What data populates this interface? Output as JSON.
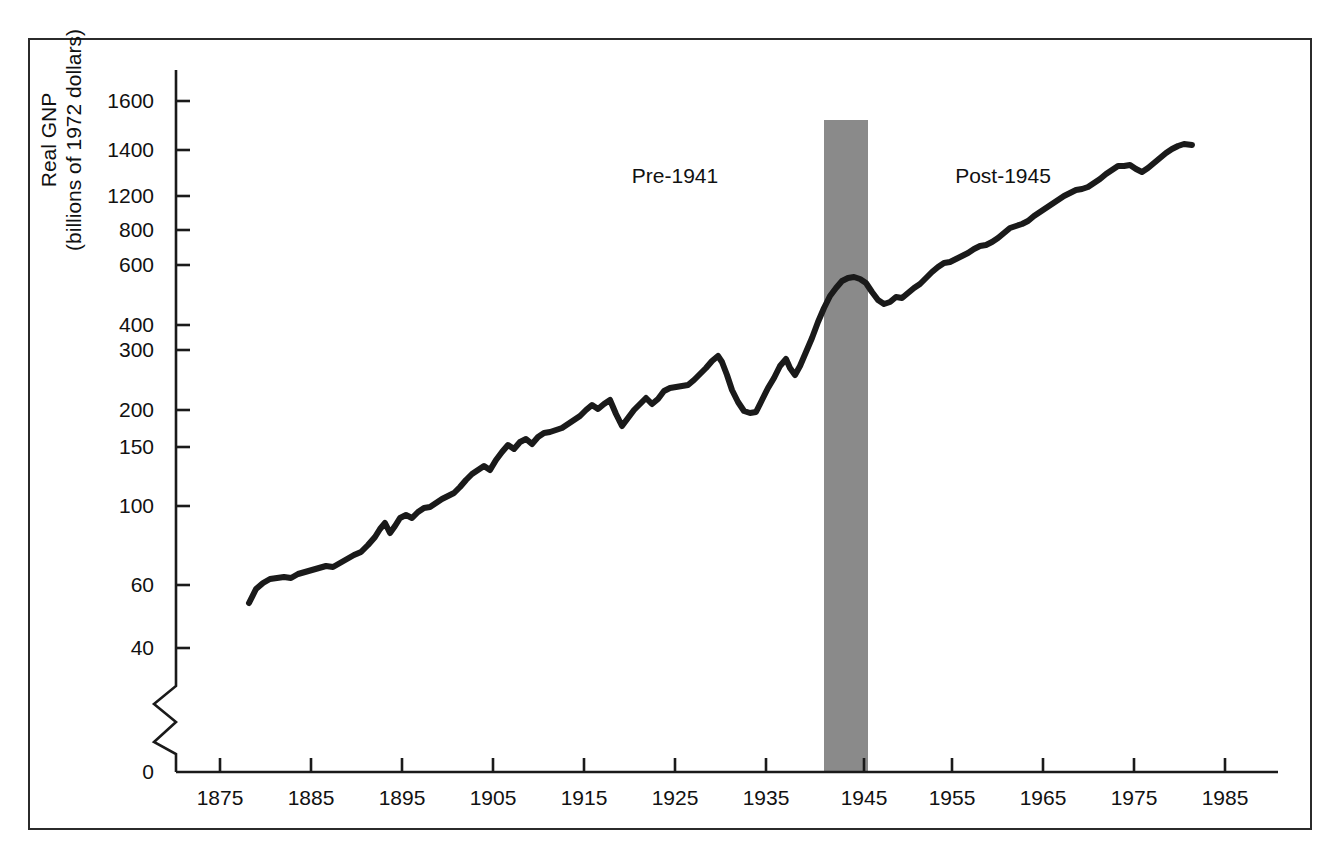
{
  "chart_data": {
    "type": "line",
    "title": "",
    "xlabel": "",
    "ylabel": "Real GNP\n(billions of 1972 dollars)",
    "ylabel_line1": "Real GNP",
    "ylabel_line2": "(billions of 1972 dollars)",
    "y_scale": "log-like-broken",
    "y_axis_note": "axis broken between 40 and 0",
    "y_ticks": [
      {
        "label": "1600",
        "value": 1600,
        "py": 101
      },
      {
        "label": "1400",
        "value": 1400,
        "py": 150
      },
      {
        "label": "1200",
        "value": 1200,
        "py": 196
      },
      {
        "label": "800",
        "value": 800,
        "py": 230
      },
      {
        "label": "600",
        "value": 600,
        "py": 265
      },
      {
        "label": "400",
        "value": 400,
        "py": 325
      },
      {
        "label": "300",
        "value": 300,
        "py": 350
      },
      {
        "label": "200",
        "value": 200,
        "py": 410
      },
      {
        "label": "150",
        "value": 150,
        "py": 447
      },
      {
        "label": "100",
        "value": 100,
        "py": 506
      },
      {
        "label": "60",
        "value": 60,
        "py": 585
      },
      {
        "label": "40",
        "value": 40,
        "py": 648
      },
      {
        "label": "0",
        "value": 0,
        "py": 772
      }
    ],
    "x_ticks": [
      {
        "label": "1875",
        "value": 1875,
        "px": 220
      },
      {
        "label": "1885",
        "value": 1885,
        "px": 311
      },
      {
        "label": "1895",
        "value": 1895,
        "px": 402
      },
      {
        "label": "1905",
        "value": 1905,
        "px": 493
      },
      {
        "label": "1915",
        "value": 1915,
        "px": 584
      },
      {
        "label": "1925",
        "value": 1925,
        "px": 675
      },
      {
        "label": "1935",
        "value": 1935,
        "px": 766
      },
      {
        "label": "1945",
        "value": 1945,
        "px": 864
      },
      {
        "label": "1955",
        "value": 1955,
        "px": 952
      },
      {
        "label": "1965",
        "value": 1965,
        "px": 1043
      },
      {
        "label": "1975",
        "value": 1975,
        "px": 1134
      },
      {
        "label": "1985",
        "value": 1985,
        "px": 1225
      }
    ],
    "xlim": [
      1869,
      1988
    ],
    "grid": false,
    "legend": null,
    "annotations": [
      {
        "text": "Pre-1941",
        "px": 675,
        "py": 176
      },
      {
        "text": "Post-1945",
        "px": 1003,
        "py": 176
      }
    ],
    "shaded_regions": [
      {
        "label": "World War II",
        "x_start": 1941,
        "x_end": 1945,
        "px_left": 824,
        "px_right": 868,
        "py_top": 120,
        "py_bottom": 772,
        "color": "#8a8a8a"
      }
    ],
    "series": [
      {
        "name": "Real GNP",
        "color": "#1a1a1a",
        "line_width": 6,
        "points": [
          [
            249,
            603
          ],
          [
            256,
            589
          ],
          [
            263,
            583
          ],
          [
            270,
            579
          ],
          [
            277,
            578
          ],
          [
            284,
            577
          ],
          [
            291,
            578
          ],
          [
            298,
            574
          ],
          [
            305,
            572
          ],
          [
            312,
            570
          ],
          [
            319,
            568
          ],
          [
            326,
            566
          ],
          [
            333,
            567
          ],
          [
            340,
            563
          ],
          [
            347,
            559
          ],
          [
            354,
            555
          ],
          [
            361,
            552
          ],
          [
            368,
            545
          ],
          [
            375,
            537
          ],
          [
            380,
            529
          ],
          [
            385,
            523
          ],
          [
            390,
            533
          ],
          [
            395,
            526
          ],
          [
            400,
            518
          ],
          [
            406,
            515
          ],
          [
            412,
            518
          ],
          [
            418,
            512
          ],
          [
            424,
            508
          ],
          [
            430,
            507
          ],
          [
            436,
            503
          ],
          [
            442,
            499
          ],
          [
            448,
            496
          ],
          [
            454,
            493
          ],
          [
            460,
            487
          ],
          [
            466,
            480
          ],
          [
            472,
            474
          ],
          [
            478,
            470
          ],
          [
            484,
            466
          ],
          [
            490,
            470
          ],
          [
            496,
            460
          ],
          [
            502,
            452
          ],
          [
            508,
            445
          ],
          [
            514,
            449
          ],
          [
            520,
            442
          ],
          [
            526,
            439
          ],
          [
            532,
            444
          ],
          [
            538,
            437
          ],
          [
            544,
            433
          ],
          [
            550,
            432
          ],
          [
            556,
            430
          ],
          [
            562,
            428
          ],
          [
            568,
            424
          ],
          [
            574,
            420
          ],
          [
            580,
            416
          ],
          [
            586,
            410
          ],
          [
            592,
            405
          ],
          [
            598,
            409
          ],
          [
            604,
            404
          ],
          [
            610,
            400
          ],
          [
            616,
            414
          ],
          [
            622,
            426
          ],
          [
            628,
            418
          ],
          [
            634,
            410
          ],
          [
            640,
            404
          ],
          [
            646,
            398
          ],
          [
            652,
            404
          ],
          [
            658,
            399
          ],
          [
            664,
            391
          ],
          [
            670,
            388
          ],
          [
            676,
            387
          ],
          [
            682,
            386
          ],
          [
            688,
            385
          ],
          [
            694,
            380
          ],
          [
            700,
            374
          ],
          [
            706,
            368
          ],
          [
            712,
            361
          ],
          [
            718,
            356
          ],
          [
            722,
            362
          ],
          [
            727,
            375
          ],
          [
            732,
            390
          ],
          [
            738,
            402
          ],
          [
            744,
            411
          ],
          [
            750,
            413
          ],
          [
            756,
            412
          ],
          [
            762,
            400
          ],
          [
            768,
            388
          ],
          [
            774,
            378
          ],
          [
            780,
            366
          ],
          [
            786,
            359
          ],
          [
            790,
            368
          ],
          [
            795,
            375
          ],
          [
            800,
            366
          ],
          [
            806,
            352
          ],
          [
            812,
            338
          ],
          [
            818,
            322
          ],
          [
            824,
            308
          ],
          [
            830,
            296
          ],
          [
            836,
            288
          ],
          [
            842,
            281
          ],
          [
            848,
            278
          ],
          [
            854,
            277
          ],
          [
            860,
            279
          ],
          [
            866,
            283
          ],
          [
            872,
            292
          ],
          [
            878,
            300
          ],
          [
            884,
            304
          ],
          [
            890,
            302
          ],
          [
            896,
            297
          ],
          [
            902,
            298
          ],
          [
            908,
            293
          ],
          [
            914,
            288
          ],
          [
            920,
            284
          ],
          [
            926,
            278
          ],
          [
            932,
            272
          ],
          [
            938,
            267
          ],
          [
            944,
            263
          ],
          [
            950,
            262
          ],
          [
            956,
            259
          ],
          [
            962,
            256
          ],
          [
            968,
            253
          ],
          [
            974,
            249
          ],
          [
            980,
            246
          ],
          [
            986,
            245
          ],
          [
            992,
            242
          ],
          [
            998,
            238
          ],
          [
            1004,
            233
          ],
          [
            1010,
            228
          ],
          [
            1016,
            226
          ],
          [
            1022,
            224
          ],
          [
            1028,
            221
          ],
          [
            1034,
            216
          ],
          [
            1040,
            212
          ],
          [
            1046,
            208
          ],
          [
            1052,
            204
          ],
          [
            1058,
            200
          ],
          [
            1064,
            196
          ],
          [
            1070,
            193
          ],
          [
            1076,
            190
          ],
          [
            1082,
            189
          ],
          [
            1088,
            187
          ],
          [
            1094,
            183
          ],
          [
            1100,
            179
          ],
          [
            1106,
            174
          ],
          [
            1112,
            170
          ],
          [
            1118,
            166
          ],
          [
            1124,
            166
          ],
          [
            1130,
            165
          ],
          [
            1136,
            169
          ],
          [
            1142,
            172
          ],
          [
            1148,
            168
          ],
          [
            1154,
            163
          ],
          [
            1160,
            158
          ],
          [
            1166,
            153
          ],
          [
            1172,
            149
          ],
          [
            1178,
            146
          ],
          [
            1184,
            144
          ],
          [
            1192,
            145
          ]
        ]
      }
    ]
  },
  "axes": {
    "y_axis_x": 176,
    "y_axis_top": 70,
    "y_axis_bottom": 772,
    "x_axis_y": 772,
    "x_axis_left": 176,
    "x_axis_right": 1278,
    "tick_length": 14,
    "break_top": 686,
    "break_bottom": 742,
    "axis_color": "#1a1a1a"
  },
  "frame": {
    "border_color": "#2b2b2b"
  }
}
